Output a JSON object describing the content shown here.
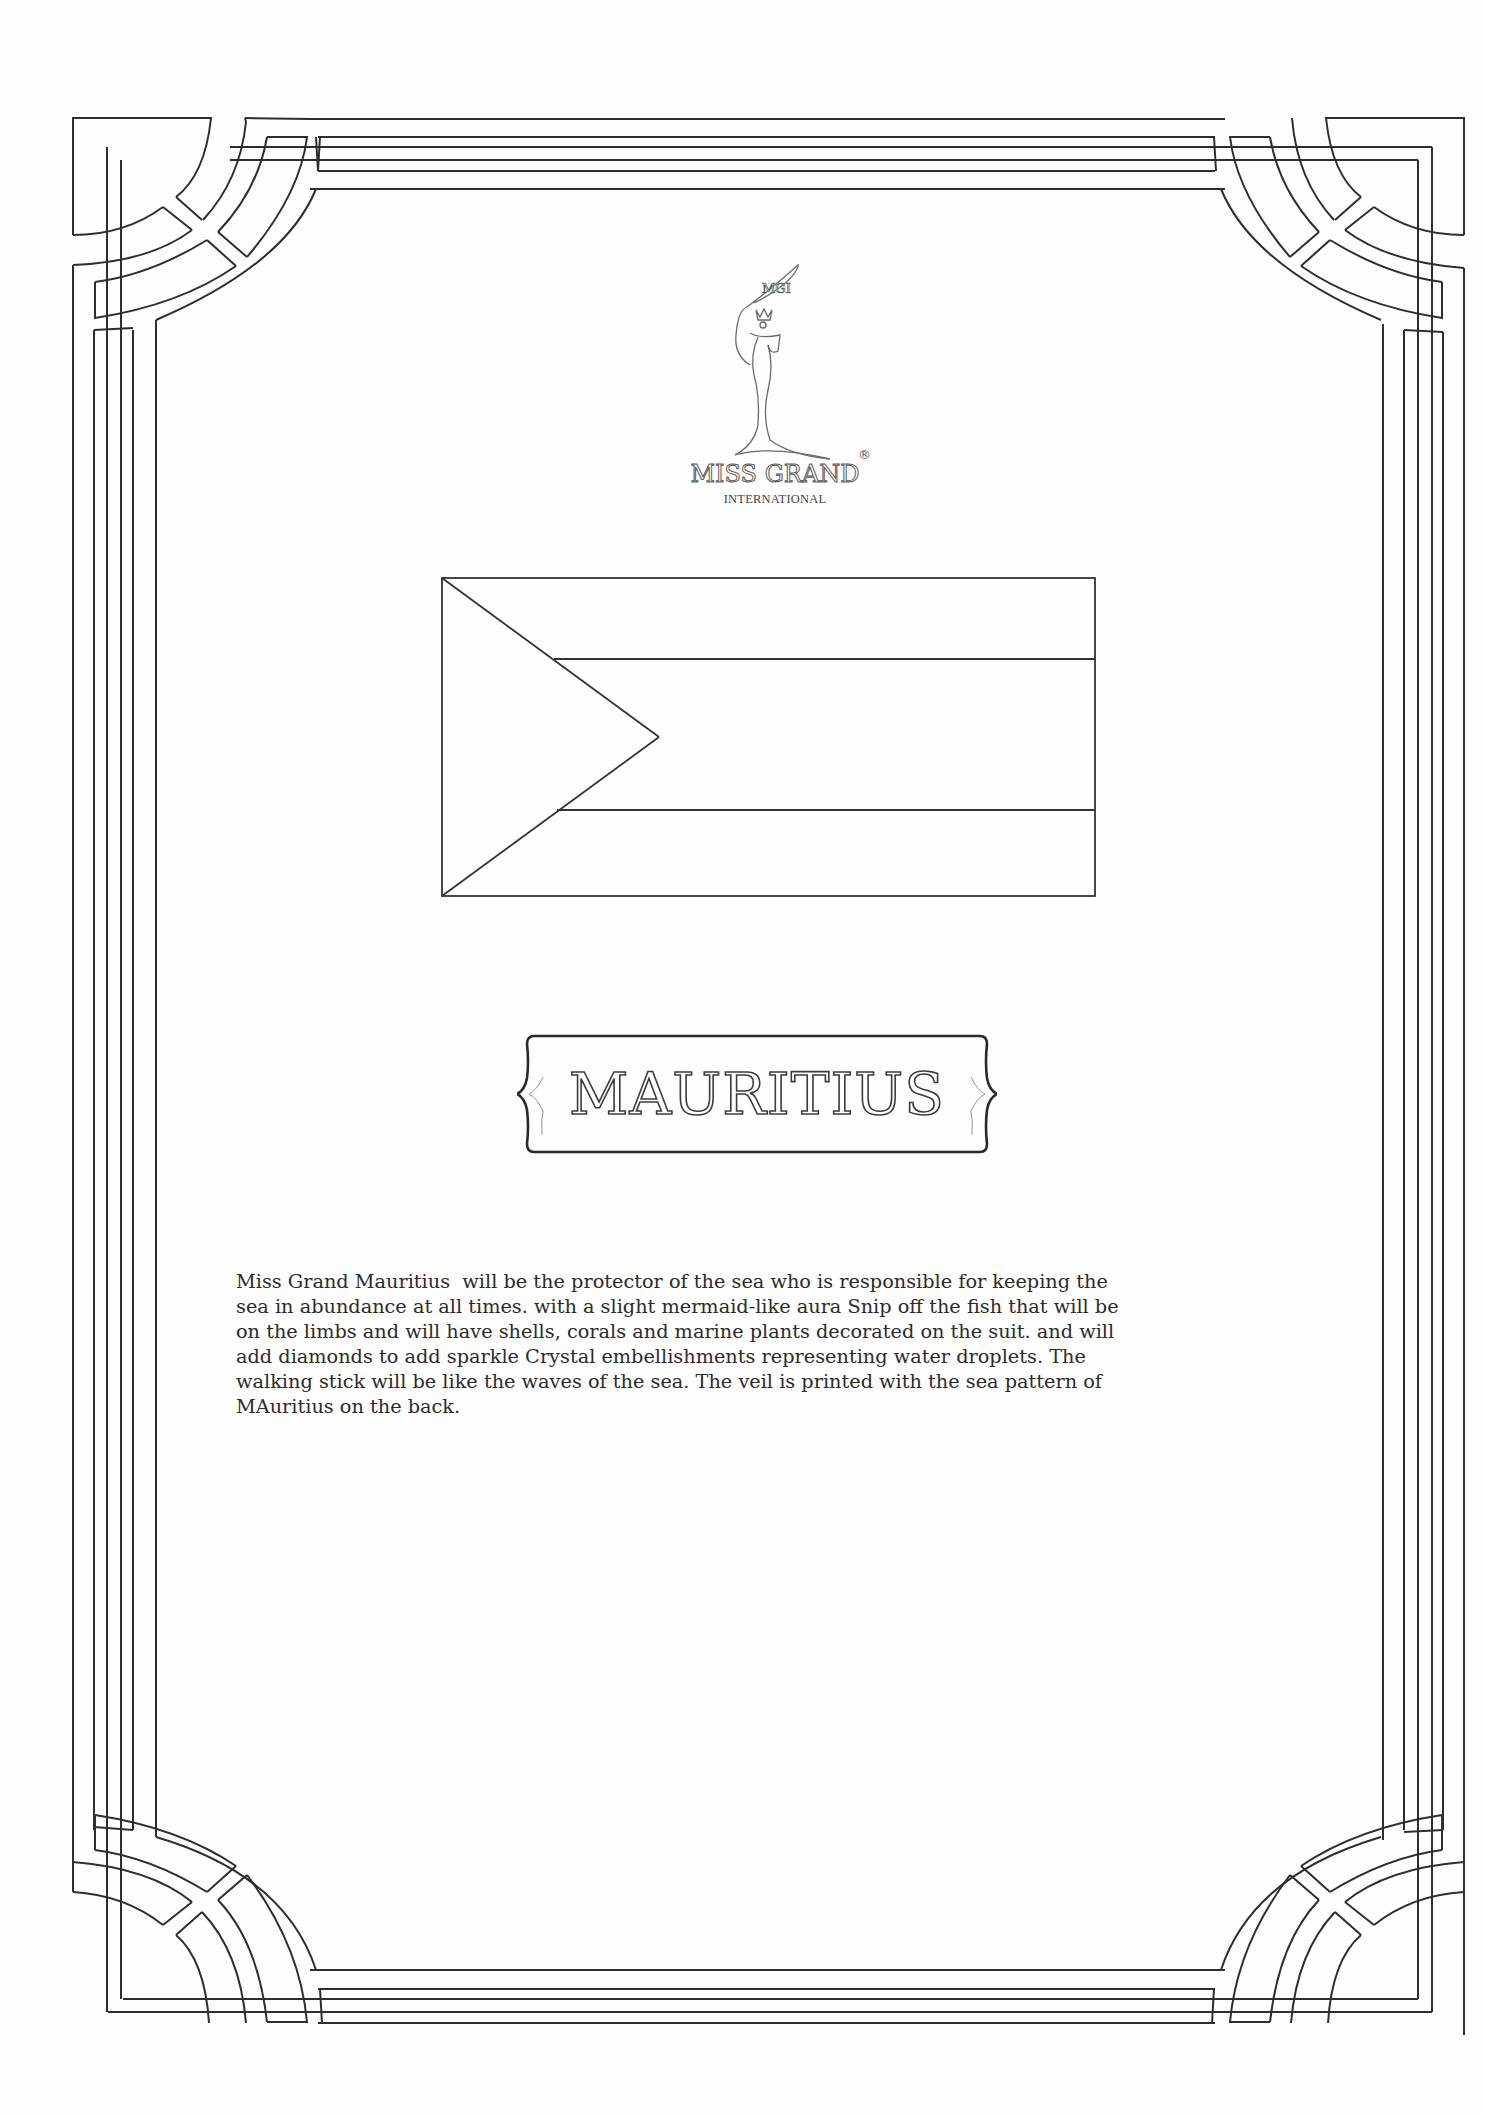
{
  "document": {
    "type": "certificate-page",
    "background_color": "#fefefe",
    "line_color": "#2e2e2e"
  },
  "logo": {
    "banner_text": "MGI",
    "brand_name": "MISS GRAND",
    "registered_mark": "®",
    "subtitle": "INTERNATIONAL"
  },
  "flag": {
    "description": "Outline of a flag with left triangle and three horizontal bands",
    "width": 655,
    "height": 319
  },
  "title": {
    "country": "MAURITIUS"
  },
  "description": {
    "lines": [
      "Miss Grand Mauritius  will be the protector of the sea who is responsible for keeping the",
      "sea in abundance at all times. with a slight mermaid-like aura Snip off the fish that will be",
      "on the limbs and will have shells, corals and marine plants decorated on the suit. and will",
      "add diamonds to add sparkle Crystal embellishments representing water droplets. The",
      "walking stick will be like the waves of the sea. The veil is printed with the sea pattern of",
      "MAuritius on the back."
    ]
  }
}
